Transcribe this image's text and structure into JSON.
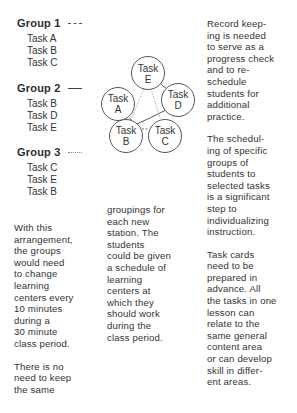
{
  "groups": [
    {
      "title": "Group 1",
      "legend_style": "dashed",
      "tasks": [
        "Task A",
        "Task B",
        "Task C"
      ]
    },
    {
      "title": "Group 2",
      "legend_style": "solid",
      "tasks": [
        "Task B",
        "Task D",
        "Task E"
      ]
    },
    {
      "title": "Group 3",
      "legend_style": "dotted",
      "tasks": [
        "Task C",
        "Task E",
        "Task B"
      ]
    }
  ],
  "diagram": {
    "nodes": [
      {
        "id": "E",
        "line1": "Task",
        "line2": "E"
      },
      {
        "id": "A",
        "line1": "Task",
        "line2": "A"
      },
      {
        "id": "D",
        "line1": "Task",
        "line2": "D"
      },
      {
        "id": "B",
        "line1": "Task",
        "line2": "B"
      },
      {
        "id": "C",
        "line1": "Task",
        "line2": "C"
      }
    ],
    "edges": [
      {
        "from": "A",
        "to": "B",
        "style": "dashed",
        "group": "Group 1"
      },
      {
        "from": "B",
        "to": "C",
        "style": "dashed",
        "group": "Group 1"
      },
      {
        "from": "E",
        "to": "D",
        "style": "solid",
        "group": "Group 2"
      },
      {
        "from": "D",
        "to": "B",
        "style": "solid",
        "group": "Group 2"
      },
      {
        "from": "C",
        "to": "E",
        "style": "dotted",
        "group": "Group 3"
      },
      {
        "from": "E",
        "to": "B",
        "style": "dotted",
        "group": "Group 3"
      }
    ]
  },
  "text": {
    "left_col": {
      "p1": "With this\narrangement,\nthe groups\nwould need\nto change\nlearning\ncenters every\n10 minutes\nduring a\n30 minute\nclass period.",
      "p2": "There is no\nneed to keep\nthe same"
    },
    "middle_col": {
      "p1": "groupings for\neach new\nstation.  The\nstudents\ncould be given\na schedule of\nlearning\ncenters at\nwhich they\nshould work\nduring the\nclass period."
    },
    "right_col": {
      "p1": "Record keep-\ning is needed\nto serve as a\nprogress check\nand to re-\nschedule\nstudents for\nadditional\npractice.",
      "p2": "The schedul-\ning of specific\ngroups of\nstudents to\nselected tasks\nis a significant\nstep to\nindividualizing\ninstruction.",
      "p3": "Task cards\nneed to be\nprepared in\nadvance.  All\nthe tasks in one\nlesson can\nrelate to the\nsame general\ncontent area\nor can develop\nskill in differ-\nent areas."
    }
  }
}
